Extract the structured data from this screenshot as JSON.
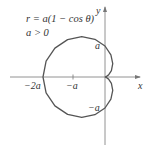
{
  "equation": {
    "line1": "r = a(1 − cos θ)",
    "line2": "a > 0"
  },
  "axes": {
    "x_label": "x",
    "y_label": "y",
    "ticks": {
      "x_neg2a": "−2a",
      "x_nega": "−a",
      "y_a": "a",
      "y_nega": "−a"
    }
  },
  "curve": {
    "type": "cardioid",
    "color": "#555555"
  }
}
